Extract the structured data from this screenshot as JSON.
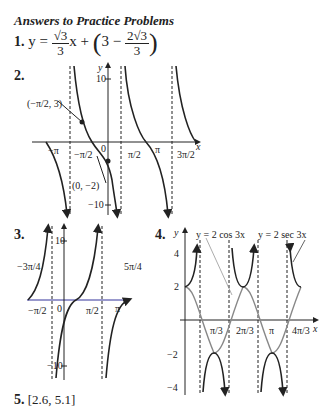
{
  "heading": "Answers to Practice Problems",
  "p1": {
    "num": "1.",
    "lhs": "y =",
    "f1n": "√3",
    "f1d": "3",
    "x": "x +",
    "lp": "(",
    "three": "3 −",
    "f2n": "2√3",
    "f2d": "3",
    "rp": ")"
  },
  "p2": {
    "num": "2.",
    "point1": "(−π/2, 3)",
    "point2": "(0, −2)",
    "ylabel": "y",
    "xlabel": "x",
    "y10": "10",
    "ym10": "−10",
    "ticks": [
      "−π",
      "−π/2",
      "0",
      "π/2",
      "π",
      "3π/2"
    ]
  },
  "p3": {
    "num": "3.",
    "y10": "10",
    "ym10": "−10",
    "left": "−3π/4",
    "right": "5π/4",
    "ticks": [
      "−π/2",
      "0",
      "π/2",
      "π"
    ]
  },
  "p4": {
    "num": "4.",
    "cos_label": "y = 2 cos 3x",
    "sec_label": "y = 2 sec 3x",
    "yticks": [
      "4",
      "2",
      "−2",
      "−4"
    ],
    "xticks": [
      "π/3",
      "2π/3",
      "π",
      "4π/3"
    ]
  },
  "p5": {
    "num": "5.",
    "answer": "[2.6, 5.1]"
  }
}
